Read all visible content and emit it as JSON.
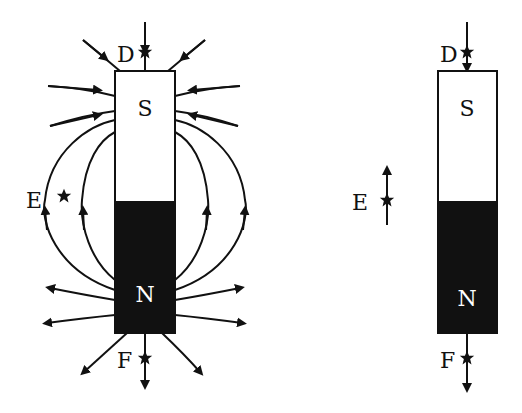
{
  "diagram": {
    "left": {
      "magnet": {
        "top_pole": "S",
        "bottom_pole": "N"
      },
      "points": {
        "D": "D",
        "E": "E",
        "F": "F"
      }
    },
    "right": {
      "magnet": {
        "top_pole": "S",
        "bottom_pole": "N"
      },
      "points": {
        "D": "D",
        "E": "E",
        "F": "F"
      }
    }
  },
  "colors": {
    "line": "#111111",
    "north_fill": "#111111",
    "south_fill": "#ffffff",
    "background": "#ffffff"
  }
}
